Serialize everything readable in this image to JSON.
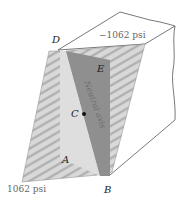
{
  "figure": {
    "labels": {
      "D": "D",
      "E": "E",
      "C": "C",
      "A": "A",
      "B": "B"
    },
    "stress_top": "−1062 psi",
    "stress_bottom": "1062 psi",
    "neutral_axis_label": "Neutral axis",
    "colors": {
      "outline": "#444444",
      "cross_section_light": "#dedede",
      "cross_section_dark": "#8f8f8f",
      "stress_hatch_bg": "#d6d6d6",
      "stress_hatch_line": "#a8a8a8",
      "centroid": "#111111"
    }
  }
}
